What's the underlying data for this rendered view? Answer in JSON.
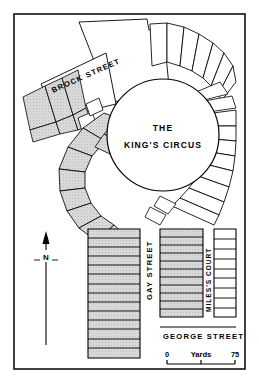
{
  "map": {
    "title_main": "THE",
    "title_sub": "KING'S CIRCUS",
    "streets": {
      "brock": "BROCK  STREET",
      "gay": "GAY  STREET",
      "miles": "MILES'S  COURT",
      "george": "GEORGE  STREET"
    },
    "compass": {
      "label": "N"
    },
    "scale": {
      "min": "0",
      "unit": "Yards",
      "max": "75"
    },
    "colors": {
      "ink": "#000000",
      "paper": "#ffffff",
      "block_fill": "#d7d7d7",
      "frame": "#111111"
    },
    "counts": {
      "west_terrace_rows": 14,
      "mid_terrace_rows": 11,
      "east_block_rows": 9,
      "circus_segments": 26
    }
  }
}
